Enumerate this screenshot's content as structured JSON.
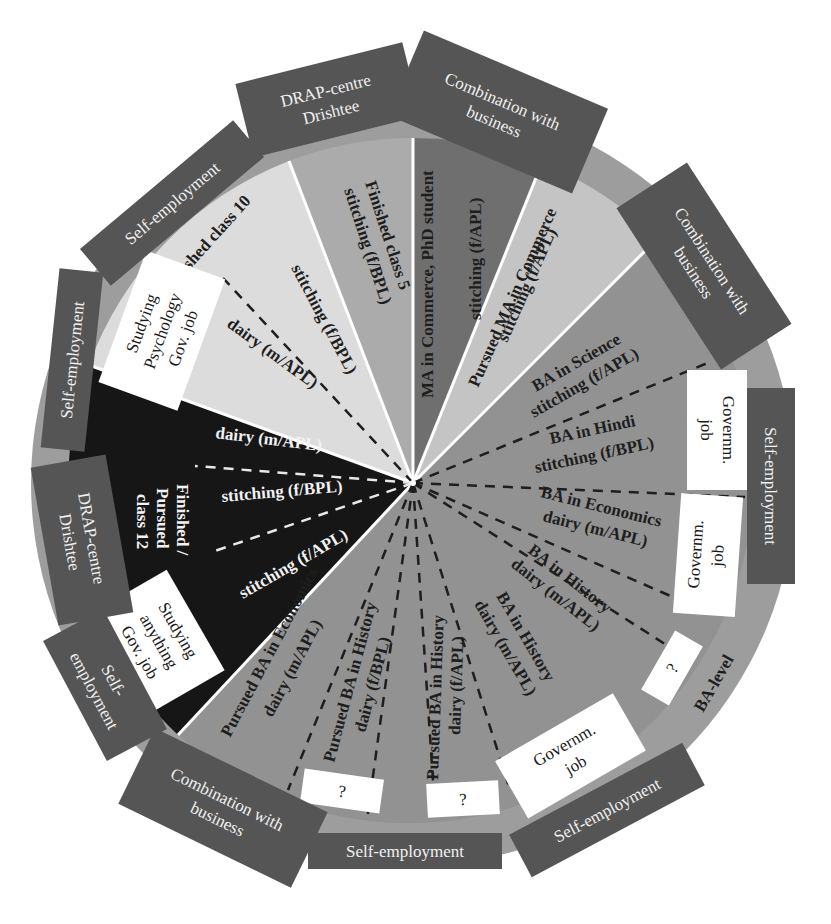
{
  "colors": {
    "outer_ring": "#9d9d9d",
    "segment_class10": "#dcdcdc",
    "segment_class5": "#ababab",
    "segment_ma_commerce": "#6f6f6f",
    "segment_pursued_ma": "#c4c4c4",
    "segment_ba": "#929292",
    "segment_class12": "#161616",
    "label_box_dark": "#555555",
    "label_box_white": "#ffffff",
    "divider": "#ffffff"
  },
  "segments": {
    "class10": {
      "title": "Finished class 10",
      "sub1": "stitching (f/BPL)",
      "sub2": "dairy (m/APL)"
    },
    "class5": {
      "line1": "Finished class 5",
      "line2": "stitching (f/BPL)"
    },
    "ma_commerce": {
      "line1": "MA in Commerce, PhD student",
      "line2": "stitching (f/APL)"
    },
    "pursued_ma": {
      "line1": "Pursued MA in Commerce",
      "line2": "stitching (f/APL)"
    },
    "ba": {
      "items": [
        {
          "line1": "BA in Science",
          "line2": "stitching (f/APL)"
        },
        {
          "line1": "BA in Hindi",
          "line2": "stitching (f/BPL)"
        },
        {
          "line1": "BA in Economics",
          "line2": "dairy (m/APL)"
        },
        {
          "line1": "BA in History",
          "line2": "dairy (m/APL)"
        },
        {
          "line1": "BA in History",
          "line2": "dairy (m/APL)"
        },
        {
          "line1": "Pursued BA in History",
          "line2": "dairy (f/APL)"
        },
        {
          "line1": "Pursued BA in History",
          "line2": "dairy (f/BPL)"
        },
        {
          "line1": "Pursued BA in Economics",
          "line2": "dairy (m/APL)"
        }
      ],
      "ring_label": "BA-level"
    },
    "class12": {
      "title_line1": "Finished /",
      "title_line2": "Pursued",
      "title_line3": "class 12",
      "sub1": "dairy (m/APL)",
      "sub2": "stitching (f/BPL)",
      "sub3": "stitching (f/APL)"
    }
  },
  "outer_labels": {
    "self_employment_upper_left": "Self-employment",
    "drap_top": {
      "line1": "DRAP-centre",
      "line2": "Drishtee"
    },
    "combination_top": {
      "line1": "Combination with",
      "line2": "business"
    },
    "combination_right": {
      "line1": "Combination with",
      "line2": "business"
    },
    "self_employment_right": "Self-employment",
    "self_employment_bottom_right": "Self-employment",
    "self_employment_bottom": "Self-employment",
    "combination_bottom_left": {
      "line1": "Combination with",
      "line2": "business"
    },
    "self_employment_left_lower": {
      "line1": "Self-",
      "line2": "employment"
    },
    "drap_left": {
      "line1": "DRAP-centre",
      "line2": "Drishtee"
    },
    "self_employment_left": "Self-employment"
  },
  "white_boxes": {
    "studying_psychology": {
      "line1": "Studying",
      "line2": "Psychology",
      "line3": "Gov. job"
    },
    "studying_anything": {
      "line1": "Studying",
      "line2": "anything",
      "line3": "Gov. job"
    },
    "govt_job_right_1": {
      "line1": "Governm.",
      "line2": "job"
    },
    "govt_job_right_2": {
      "line1": "Governm.",
      "line2": "job"
    },
    "question_right": "?",
    "govt_job_bottom": {
      "line1": "Governm.",
      "line2": "job"
    },
    "question_bottom_1": "?",
    "question_bottom_2": "?"
  }
}
